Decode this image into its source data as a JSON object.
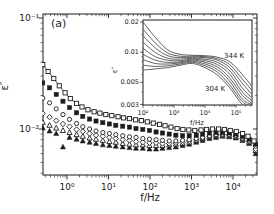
{
  "figure": {
    "panel_label": "(a)",
    "background": "#ffffff",
    "ink_color": "#1c1c1c"
  },
  "chart_data": {
    "type": "scatter",
    "title": "",
    "main": {
      "xlabel": "f/Hz",
      "ylabel": "ε″",
      "x_scale": "log",
      "y_scale": "log",
      "xlim": [
        0.26,
        38000
      ],
      "ylim": [
        0.0039,
        0.109
      ],
      "grid": false,
      "x_ticks": [
        {
          "value": 1,
          "label": "10⁰"
        },
        {
          "value": 10,
          "label": "10¹"
        },
        {
          "value": 100,
          "label": "10²"
        },
        {
          "value": 1000,
          "label": "10³"
        },
        {
          "value": 10000,
          "label": "10⁴"
        }
      ],
      "y_ticks": [
        {
          "value": 0.1,
          "label": "10⁻¹"
        },
        {
          "value": 0.01,
          "label": "10⁻²"
        }
      ],
      "series": [
        {
          "marker": "open-square",
          "line": true,
          "points": [
            [
              0.26,
              0.038
            ],
            [
              0.35,
              0.033
            ],
            [
              0.48,
              0.0285
            ],
            [
              0.65,
              0.0245
            ],
            [
              0.9,
              0.0212
            ],
            [
              1.2,
              0.0188
            ],
            [
              1.7,
              0.017
            ],
            [
              2.3,
              0.0158
            ],
            [
              3.2,
              0.0149
            ],
            [
              4.5,
              0.0143
            ],
            [
              6.2,
              0.0139
            ],
            [
              8.6,
              0.0135
            ],
            [
              12,
              0.0132
            ],
            [
              17,
              0.0129
            ],
            [
              23,
              0.0126
            ],
            [
              32,
              0.0124
            ],
            [
              45,
              0.0121
            ],
            [
              62,
              0.0119
            ],
            [
              86,
              0.0116
            ],
            [
              120,
              0.0113
            ],
            [
              170,
              0.011
            ],
            [
              230,
              0.0107
            ],
            [
              320,
              0.0104
            ],
            [
              450,
              0.0101
            ],
            [
              620,
              0.0099
            ],
            [
              860,
              0.0098
            ],
            [
              1200,
              0.0097
            ],
            [
              1700,
              0.0098
            ],
            [
              2300,
              0.0099
            ],
            [
              3200,
              0.01
            ],
            [
              4500,
              0.01
            ],
            [
              6200,
              0.0099
            ],
            [
              8600,
              0.0097
            ],
            [
              12000,
              0.0095
            ],
            [
              17000,
              0.0091
            ],
            [
              23000,
              0.0086
            ],
            [
              32000,
              0.0078
            ]
          ]
        },
        {
          "marker": "filled-square",
          "line": false,
          "points": [
            [
              0.26,
              0.026
            ],
            [
              0.38,
              0.0235
            ],
            [
              0.55,
              0.0205
            ],
            [
              0.8,
              0.0178
            ],
            [
              1.15,
              0.0156
            ],
            [
              1.7,
              0.014
            ],
            [
              2.4,
              0.013
            ],
            [
              3.5,
              0.0123
            ],
            [
              5,
              0.0118
            ],
            [
              7.3,
              0.0114
            ],
            [
              10.5,
              0.0111
            ],
            [
              15,
              0.0108
            ],
            [
              22,
              0.0106
            ],
            [
              32,
              0.0104
            ],
            [
              46,
              0.0101
            ],
            [
              67,
              0.0099
            ],
            [
              97,
              0.0097
            ],
            [
              140,
              0.0094
            ],
            [
              200,
              0.0092
            ],
            [
              290,
              0.009
            ],
            [
              420,
              0.0088
            ],
            [
              610,
              0.0087
            ],
            [
              880,
              0.0087
            ],
            [
              1300,
              0.0088
            ],
            [
              1850,
              0.009
            ],
            [
              2700,
              0.0092
            ],
            [
              3900,
              0.0093
            ],
            [
              5600,
              0.0093
            ],
            [
              8100,
              0.0092
            ],
            [
              11700,
              0.009
            ],
            [
              17000,
              0.0086
            ],
            [
              24500,
              0.0081
            ],
            [
              35000,
              0.0073
            ]
          ]
        },
        {
          "marker": "open-circle",
          "line": false,
          "points": [
            [
              0.26,
              0.019
            ],
            [
              0.38,
              0.0172
            ],
            [
              0.55,
              0.0152
            ],
            [
              0.8,
              0.0135
            ],
            [
              1.15,
              0.0122
            ],
            [
              1.7,
              0.0112
            ],
            [
              2.4,
              0.0105
            ],
            [
              3.5,
              0.01
            ],
            [
              5,
              0.0096
            ],
            [
              7.3,
              0.0093
            ],
            [
              10.5,
              0.0091
            ],
            [
              15,
              0.0089
            ],
            [
              22,
              0.0087
            ],
            [
              32,
              0.0085
            ],
            [
              46,
              0.0084
            ],
            [
              67,
              0.0082
            ],
            [
              97,
              0.0081
            ],
            [
              140,
              0.008
            ],
            [
              200,
              0.0079
            ],
            [
              290,
              0.0078
            ],
            [
              420,
              0.0078
            ],
            [
              610,
              0.0079
            ],
            [
              880,
              0.008
            ],
            [
              1300,
              0.0082
            ],
            [
              1850,
              0.0084
            ],
            [
              2700,
              0.0087
            ],
            [
              3900,
              0.0089
            ],
            [
              5600,
              0.009
            ],
            [
              8100,
              0.0089
            ],
            [
              11700,
              0.0087
            ],
            [
              17000,
              0.0083
            ],
            [
              24500,
              0.0078
            ],
            [
              35000,
              0.007
            ]
          ]
        },
        {
          "marker": "open-diamond",
          "line": false,
          "points": [
            [
              0.26,
              0.0138
            ],
            [
              0.38,
              0.0128
            ],
            [
              0.55,
              0.0119
            ],
            [
              0.8,
              0.0111
            ],
            [
              1.15,
              0.0105
            ],
            [
              1.7,
              0.0099
            ],
            [
              2.4,
              0.0095
            ],
            [
              3.5,
              0.0091
            ],
            [
              5,
              0.0088
            ],
            [
              7.3,
              0.0086
            ],
            [
              10.5,
              0.0084
            ],
            [
              15,
              0.0082
            ],
            [
              22,
              0.008
            ],
            [
              32,
              0.0079
            ],
            [
              46,
              0.0077
            ],
            [
              67,
              0.0076
            ],
            [
              97,
              0.0075
            ],
            [
              140,
              0.0075
            ],
            [
              200,
              0.0074
            ],
            [
              290,
              0.0074
            ],
            [
              420,
              0.0075
            ],
            [
              610,
              0.0076
            ],
            [
              880,
              0.0078
            ],
            [
              1300,
              0.008
            ],
            [
              1850,
              0.0083
            ],
            [
              2700,
              0.0086
            ],
            [
              3900,
              0.0088
            ],
            [
              5600,
              0.0089
            ],
            [
              8100,
              0.0088
            ],
            [
              11700,
              0.0086
            ],
            [
              17000,
              0.0082
            ],
            [
              24500,
              0.0077
            ],
            [
              35000,
              0.0066
            ]
          ]
        },
        {
          "marker": "open-triangle",
          "line": false,
          "points": [
            [
              0.26,
              0.0115
            ],
            [
              0.38,
              0.0108
            ],
            [
              0.55,
              0.0102
            ],
            [
              0.8,
              0.0097
            ],
            [
              1.15,
              0.0093
            ],
            [
              1.7,
              0.0089
            ],
            [
              2.4,
              0.0086
            ],
            [
              3.5,
              0.0083
            ],
            [
              5,
              0.0081
            ],
            [
              7.3,
              0.0079
            ],
            [
              10.5,
              0.0077
            ],
            [
              15,
              0.0076
            ],
            [
              22,
              0.0074
            ],
            [
              32,
              0.0073
            ],
            [
              46,
              0.0072
            ],
            [
              67,
              0.0072
            ],
            [
              97,
              0.0071
            ],
            [
              140,
              0.0071
            ],
            [
              200,
              0.0071
            ],
            [
              290,
              0.0072
            ],
            [
              420,
              0.0073
            ],
            [
              610,
              0.0074
            ],
            [
              880,
              0.0076
            ],
            [
              1300,
              0.0079
            ],
            [
              1850,
              0.0082
            ],
            [
              2700,
              0.0085
            ],
            [
              3900,
              0.0087
            ],
            [
              5600,
              0.0088
            ],
            [
              8100,
              0.0087
            ],
            [
              11700,
              0.0085
            ],
            [
              17000,
              0.0081
            ],
            [
              24500,
              0.0076
            ],
            [
              35000,
              0.0064
            ]
          ]
        },
        {
          "marker": "filled-triangle",
          "line": false,
          "points": [
            [
              0.26,
              0.0102
            ],
            [
              0.38,
              0.0096
            ],
            [
              0.55,
              0.0091
            ],
            [
              0.8,
              0.0069
            ],
            [
              1.15,
              0.0084
            ],
            [
              1.7,
              0.0081
            ],
            [
              2.4,
              0.0078
            ],
            [
              3.5,
              0.0076
            ],
            [
              5,
              0.0074
            ],
            [
              7.3,
              0.0072
            ],
            [
              10.5,
              0.0071
            ],
            [
              15,
              0.007
            ],
            [
              22,
              0.0069
            ],
            [
              32,
              0.0068
            ],
            [
              46,
              0.0067
            ],
            [
              67,
              0.0067
            ],
            [
              97,
              0.0066
            ],
            [
              140,
              0.0066
            ],
            [
              200,
              0.0067
            ],
            [
              290,
              0.0068
            ],
            [
              420,
              0.0069
            ],
            [
              610,
              0.0071
            ],
            [
              880,
              0.0073
            ],
            [
              1300,
              0.0076
            ],
            [
              1850,
              0.0079
            ],
            [
              2700,
              0.0082
            ],
            [
              3900,
              0.0084
            ],
            [
              5600,
              0.0086
            ],
            [
              8100,
              0.0085
            ],
            [
              11700,
              0.0083
            ],
            [
              17000,
              0.0079
            ],
            [
              24500,
              0.0074
            ],
            [
              35000,
              0.006
            ]
          ]
        }
      ]
    },
    "inset": {
      "type": "line",
      "xlabel": "f/Hz",
      "ylabel": "ε″",
      "x_scale": "log",
      "y_scale": "log",
      "xlim": [
        100,
        316000
      ],
      "ylim": [
        0.003,
        0.021
      ],
      "x_ticks": [
        {
          "value": 100,
          "label": "10²"
        },
        {
          "value": 1000,
          "label": "10³"
        },
        {
          "value": 10000,
          "label": "10⁴"
        },
        {
          "value": 100000,
          "label": "10⁵"
        }
      ],
      "y_ticks": [
        {
          "value": 0.02,
          "label": "0.02"
        },
        {
          "value": 0.01,
          "label": "0.01"
        },
        {
          "value": 0.005,
          "label": "0.005"
        },
        {
          "value": 0.003,
          "label": "0.003"
        }
      ],
      "annotations": [
        {
          "text": "344 K",
          "x": 224,
          "y": 58
        },
        {
          "text": "304 K",
          "x": 205,
          "y": 91
        }
      ],
      "log_f_anchors": [
        2.0,
        2.4,
        2.8,
        3.2,
        3.6,
        4.0,
        4.4,
        4.8,
        5.2,
        5.5
      ],
      "series": [
        {
          "temperature_K": 344,
          "values": [
            0.02,
            0.014,
            0.0105,
            0.0095,
            0.0093,
            0.0092,
            0.0089,
            0.008,
            0.006,
            0.0046
          ]
        },
        {
          "temperature_K": 339,
          "values": [
            0.017,
            0.0123,
            0.0098,
            0.0091,
            0.0091,
            0.009,
            0.0086,
            0.0075,
            0.0054,
            0.0042
          ]
        },
        {
          "temperature_K": 334,
          "values": [
            0.0146,
            0.011,
            0.0092,
            0.0088,
            0.0089,
            0.0088,
            0.0083,
            0.007,
            0.0049,
            0.0038
          ]
        },
        {
          "temperature_K": 329,
          "values": [
            0.0126,
            0.0099,
            0.0087,
            0.0085,
            0.0087,
            0.0085,
            0.0079,
            0.0065,
            0.0044,
            0.0035
          ]
        },
        {
          "temperature_K": 324,
          "values": [
            0.0109,
            0.009,
            0.0083,
            0.0082,
            0.0085,
            0.0082,
            0.0075,
            0.006,
            0.004,
            0.0033
          ]
        },
        {
          "temperature_K": 319,
          "values": [
            0.0095,
            0.0083,
            0.0079,
            0.008,
            0.0083,
            0.0079,
            0.0071,
            0.0055,
            0.0037,
            0.0031
          ]
        },
        {
          "temperature_K": 314,
          "values": [
            0.0084,
            0.0077,
            0.0076,
            0.0078,
            0.0081,
            0.0076,
            0.0067,
            0.0051,
            0.0034,
            0.003
          ]
        },
        {
          "temperature_K": 309,
          "values": [
            0.0074,
            0.0072,
            0.0073,
            0.0076,
            0.0079,
            0.0073,
            0.0063,
            0.0047,
            0.0032,
            0.0029
          ]
        },
        {
          "temperature_K": 304,
          "values": [
            0.0066,
            0.0068,
            0.007,
            0.0074,
            0.0077,
            0.007,
            0.0059,
            0.0044,
            0.003,
            0.0028
          ]
        }
      ]
    }
  }
}
